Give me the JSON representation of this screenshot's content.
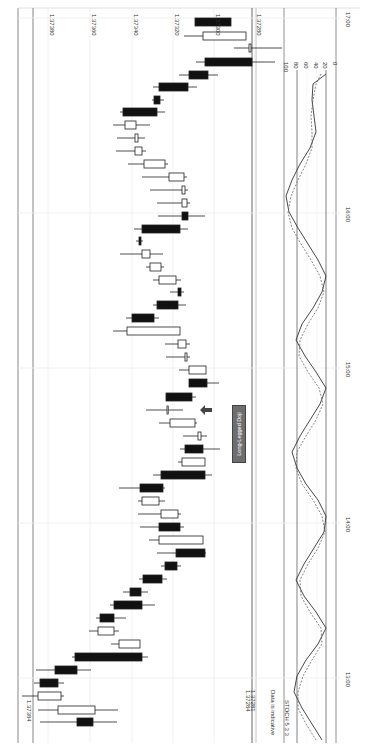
{
  "chart_data": {
    "type": "candlestick",
    "orientation": "rotated-90-clockwise",
    "title": "",
    "price_axis": {
      "ticks": [
        {
          "label": "1.37380",
          "x": 48
        },
        {
          "label": "1.37360",
          "x": 90
        },
        {
          "label": "1.37340",
          "x": 132
        },
        {
          "label": "1.37320",
          "x": 173
        },
        {
          "label": "1.37300",
          "x": 214
        },
        {
          "label": "1.37280",
          "x": 255
        }
      ],
      "range": [
        1.3728,
        1.3739
      ]
    },
    "time_axis": {
      "ticks": [
        {
          "label": "17:00",
          "y": 18
        },
        {
          "label": "16:00",
          "y": 213
        },
        {
          "label": "15:00",
          "y": 368
        },
        {
          "label": "14:00",
          "y": 523
        },
        {
          "label": "13:00",
          "y": 678
        }
      ]
    },
    "current_price_labels": [
      "1.37284",
      "1.37281"
    ],
    "left_price_label": "1.37384",
    "annotation": "Long-Legged Doji",
    "indicator": {
      "name": "STOCH 5 3 3",
      "scale": [
        "100",
        "80",
        "60",
        "40",
        "20",
        "0"
      ],
      "levels": [
        80,
        20
      ],
      "k_line_y": [
        14,
        24,
        40,
        56,
        72,
        88,
        104,
        120,
        136,
        152,
        168,
        184,
        200,
        216,
        232,
        248,
        264,
        280,
        296,
        312,
        328,
        344,
        360,
        376,
        392,
        408,
        424,
        440,
        456,
        472,
        488,
        504,
        520,
        536,
        552,
        568,
        584,
        600,
        616,
        632,
        648,
        664,
        680,
        696,
        712,
        728,
        744
      ],
      "k_line_x": [
        326,
        313,
        312,
        314,
        316,
        310,
        300,
        292,
        286,
        289,
        298,
        308,
        318,
        326,
        322,
        313,
        302,
        296,
        305,
        316,
        326,
        320,
        310,
        300,
        292,
        297,
        306,
        318,
        326,
        324,
        314,
        304,
        296,
        304,
        316,
        326,
        318,
        306,
        297,
        294,
        302,
        312,
        322,
        318,
        306,
        296,
        287
      ],
      "d_line_x": [
        321,
        316,
        313,
        311,
        312,
        312,
        306,
        298,
        291,
        288,
        292,
        301,
        311,
        320,
        324,
        318,
        308,
        300,
        299,
        308,
        319,
        323,
        316,
        306,
        297,
        296,
        302,
        313,
        322,
        325,
        318,
        308,
        300,
        301,
        310,
        321,
        322,
        312,
        303,
        298,
        298,
        306,
        316,
        320,
        314,
        302,
        292
      ]
    },
    "candles": [
      {
        "y": 22,
        "o": 1.373,
        "c": 1.373,
        "bx": [
          195,
          231
        ],
        "wx": [
          195,
          231
        ],
        "filled": true
      },
      {
        "y": 36,
        "bx": [
          203,
          246
        ],
        "wx": [
          184,
          246
        ],
        "filled": false
      },
      {
        "y": 48,
        "bx": [
          249,
          251
        ],
        "wx": [
          234,
          282
        ],
        "filled": false
      },
      {
        "y": 62,
        "bx": [
          205,
          252
        ],
        "wx": [
          196,
          275
        ],
        "filled": true
      },
      {
        "y": 75,
        "bx": [
          189,
          208
        ],
        "wx": [
          179,
          218
        ],
        "filled": true
      },
      {
        "y": 87,
        "bx": [
          159,
          188
        ],
        "wx": [
          153,
          197
        ],
        "filled": true
      },
      {
        "y": 100,
        "bx": [
          154,
          160
        ],
        "wx": [
          152,
          164
        ],
        "filled": true
      },
      {
        "y": 112,
        "bx": [
          123,
          157
        ],
        "wx": [
          120,
          165
        ],
        "filled": true
      },
      {
        "y": 125,
        "bx": [
          125,
          136
        ],
        "wx": [
          113,
          150
        ],
        "filled": false
      },
      {
        "y": 138,
        "bx": [
          135,
          138
        ],
        "wx": [
          117,
          145
        ],
        "filled": false
      },
      {
        "y": 151,
        "bx": [
          135,
          142
        ],
        "wx": [
          116,
          146
        ],
        "filled": false
      },
      {
        "y": 164,
        "bx": [
          144,
          165
        ],
        "wx": [
          128,
          168
        ],
        "filled": false
      },
      {
        "y": 177,
        "bx": [
          169,
          184
        ],
        "wx": [
          142,
          187
        ],
        "filled": false
      },
      {
        "y": 190,
        "bx": [
          182,
          185
        ],
        "wx": [
          150,
          188
        ],
        "filled": false
      },
      {
        "y": 203,
        "bx": [
          182,
          187
        ],
        "wx": [
          157,
          190
        ],
        "filled": false
      },
      {
        "y": 216,
        "bx": [
          182,
          188
        ],
        "wx": [
          158,
          205
        ],
        "filled": true
      },
      {
        "y": 229,
        "bx": [
          142,
          180
        ],
        "wx": [
          134,
          188
        ],
        "filled": true
      },
      {
        "y": 241,
        "bx": [
          139,
          141
        ],
        "wx": [
          136,
          143
        ],
        "filled": true
      },
      {
        "y": 254,
        "bx": [
          142,
          150
        ],
        "wx": [
          120,
          163
        ],
        "filled": false
      },
      {
        "y": 267,
        "bx": [
          150,
          161
        ],
        "wx": [
          146,
          164
        ],
        "filled": false
      },
      {
        "y": 280,
        "bx": [
          159,
          176
        ],
        "wx": [
          153,
          181
        ],
        "filled": false
      },
      {
        "y": 292,
        "bx": [
          178,
          181
        ],
        "wx": [
          170,
          184
        ],
        "filled": true
      },
      {
        "y": 305,
        "bx": [
          157,
          178
        ],
        "wx": [
          153,
          186
        ],
        "filled": true
      },
      {
        "y": 318,
        "bx": [
          132,
          154
        ],
        "wx": [
          126,
          159
        ],
        "filled": true
      },
      {
        "y": 331,
        "bx": [
          127,
          180
        ],
        "wx": [
          113,
          180
        ],
        "filled": false
      },
      {
        "y": 344,
        "bx": [
          178,
          186
        ],
        "wx": [
          165,
          190
        ],
        "filled": false
      },
      {
        "y": 357,
        "bx": [
          185,
          187
        ],
        "wx": [
          166,
          190
        ],
        "filled": false
      },
      {
        "y": 370,
        "bx": [
          189,
          206
        ],
        "wx": [
          179,
          206
        ],
        "filled": false
      },
      {
        "y": 383,
        "bx": [
          189,
          207
        ],
        "wx": [
          189,
          219
        ],
        "filled": true
      },
      {
        "y": 397,
        "bx": [
          166,
          192
        ],
        "wx": [
          166,
          196
        ],
        "filled": true
      },
      {
        "y": 410,
        "bx": [
          167,
          167
        ],
        "wx": [
          146,
          183
        ],
        "filled": false
      },
      {
        "y": 423,
        "bx": [
          170,
          195
        ],
        "wx": [
          159,
          197
        ],
        "filled": false
      },
      {
        "y": 436,
        "bx": [
          198,
          201
        ],
        "wx": [
          183,
          207
        ],
        "filled": false
      },
      {
        "y": 449,
        "bx": [
          185,
          203
        ],
        "wx": [
          180,
          220
        ],
        "filled": true
      },
      {
        "y": 462,
        "bx": [
          182,
          205
        ],
        "wx": [
          178,
          205
        ],
        "filled": false
      },
      {
        "y": 475,
        "bx": [
          161,
          205
        ],
        "wx": [
          153,
          212
        ],
        "filled": true
      },
      {
        "y": 488,
        "bx": [
          140,
          163
        ],
        "wx": [
          119,
          165
        ],
        "filled": true
      },
      {
        "y": 501,
        "bx": [
          142,
          159
        ],
        "wx": [
          138,
          165
        ],
        "filled": false
      },
      {
        "y": 514,
        "bx": [
          161,
          178
        ],
        "wx": [
          138,
          181
        ],
        "filled": false
      },
      {
        "y": 527,
        "bx": [
          159,
          180
        ],
        "wx": [
          140,
          184
        ],
        "filled": true
      },
      {
        "y": 540,
        "bx": [
          159,
          203
        ],
        "wx": [
          149,
          203
        ],
        "filled": false
      },
      {
        "y": 553,
        "bx": [
          176,
          205
        ],
        "wx": [
          157,
          206
        ],
        "filled": true
      },
      {
        "y": 566,
        "bx": [
          165,
          177
        ],
        "wx": [
          161,
          181
        ],
        "filled": true
      },
      {
        "y": 579,
        "bx": [
          143,
          162
        ],
        "wx": [
          139,
          167
        ],
        "filled": true
      },
      {
        "y": 592,
        "bx": [
          130,
          141
        ],
        "wx": [
          123,
          148
        ],
        "filled": true
      },
      {
        "y": 605,
        "bx": [
          114,
          142
        ],
        "wx": [
          110,
          155
        ],
        "filled": true
      },
      {
        "y": 618,
        "bx": [
          100,
          114
        ],
        "wx": [
          96,
          126
        ],
        "filled": true
      },
      {
        "y": 631,
        "bx": [
          98,
          114
        ],
        "wx": [
          89,
          119
        ],
        "filled": false
      },
      {
        "y": 644,
        "bx": [
          119,
          140
        ],
        "wx": [
          111,
          140
        ],
        "filled": false
      },
      {
        "y": 657,
        "bx": [
          75,
          142
        ],
        "wx": [
          72,
          148
        ],
        "filled": true
      },
      {
        "y": 670,
        "bx": [
          55,
          77
        ],
        "wx": [
          36,
          91
        ],
        "filled": true
      },
      {
        "y": 683,
        "bx": [
          40,
          58
        ],
        "wx": [
          34,
          64
        ],
        "filled": true
      },
      {
        "y": 696,
        "bx": [
          38,
          61
        ],
        "wx": [
          22,
          64
        ],
        "filled": false
      },
      {
        "y": 710,
        "bx": [
          58,
          95
        ],
        "wx": [
          38,
          118
        ],
        "filled": false
      },
      {
        "y": 722,
        "bx": [
          77,
          93
        ],
        "wx": [
          40,
          117
        ],
        "filled": true
      }
    ]
  },
  "labels": {
    "disclaimer": "Data is indicative",
    "indicator_name": "STOCH 5 3 3",
    "annotation": "Long-Legged Doji"
  }
}
